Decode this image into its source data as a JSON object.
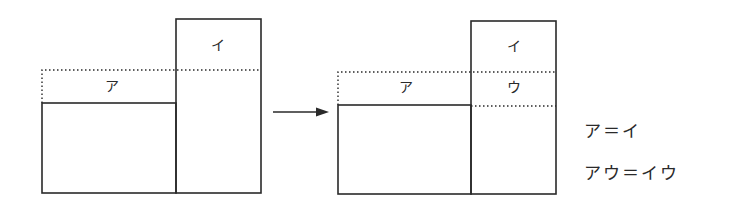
{
  "colors": {
    "line": "#2a2a2a",
    "background": "#ffffff"
  },
  "left_figure": {
    "label_a": "ア",
    "label_i": "イ"
  },
  "arrow": {
    "icon": "right-arrow-icon"
  },
  "right_figure": {
    "label_a": "ア",
    "label_i": "イ",
    "label_u": "ウ"
  },
  "equations": [
    "ア＝イ",
    "アウ＝イウ"
  ]
}
